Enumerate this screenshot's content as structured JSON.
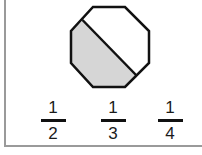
{
  "figure": {
    "shape": "regular-octagon",
    "shaded_fraction": "1/2",
    "shade_color": "#d6d6d6",
    "stroke_color": "#111111",
    "border_color": "#9a9a9a"
  },
  "options": [
    {
      "numerator": "1",
      "denominator": "2"
    },
    {
      "numerator": "1",
      "denominator": "3"
    },
    {
      "numerator": "1",
      "denominator": "4"
    }
  ]
}
